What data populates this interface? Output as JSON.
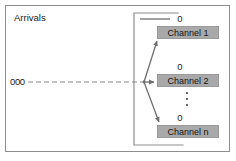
{
  "figure": {
    "width": 236,
    "height": 161,
    "background_color": "#ffffff",
    "frame_color": "#8e8e8e"
  },
  "labels": {
    "arrivals": "Arrivals",
    "queue": "000"
  },
  "service_facility": {
    "border_color": "#8e8e8e",
    "open_side": "right"
  },
  "channels": [
    {
      "name": "Channel 1",
      "departure_label": "0"
    },
    {
      "name": "Channel 2",
      "departure_label": "0"
    },
    {
      "name": "Channel n",
      "departure_label": "0"
    }
  ],
  "continuation": {
    "symbol": "vertical-ellipsis",
    "dot_count": 3
  },
  "colors": {
    "channel_fill": "#a9a9a9",
    "channel_border": "#9a9a9a",
    "line": "#6e6e6e",
    "text": "#1b1b1b"
  }
}
